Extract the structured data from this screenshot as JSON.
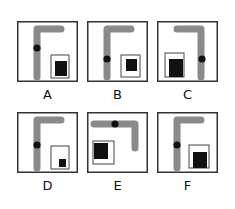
{
  "title": "",
  "colors": {
    "frame": "#333333",
    "bar": "#8a8a8a",
    "dot": "#111111",
    "square": "#111111",
    "inner_box": "#444444"
  },
  "options": [
    {
      "label": "A",
      "x": 17,
      "y": 21,
      "bar": "M20 8 L20 56 M20 8 L44 8",
      "dot": [
        20,
        27
      ],
      "box": [
        34,
        34,
        18,
        23
      ],
      "fill": [
        38,
        40,
        12,
        15
      ]
    },
    {
      "label": "B",
      "x": 87,
      "y": 21,
      "bar": "M20 8 L20 56 M20 8 L44 8",
      "dot": [
        20,
        38
      ],
      "box": [
        34,
        34,
        19,
        22
      ],
      "fill": [
        39,
        38,
        11,
        12
      ]
    },
    {
      "label": "C",
      "x": 157,
      "y": 21,
      "bar": "M44 8 L44 56 M20 8 L44 8",
      "dot": [
        45,
        38
      ],
      "box": [
        8,
        32,
        19,
        24
      ],
      "fill": [
        12,
        38,
        14,
        18
      ]
    },
    {
      "label": "D",
      "x": 17,
      "y": 112,
      "bar": "M20 8 L20 56 M20 8 L44 8",
      "dot": [
        20,
        33
      ],
      "box": [
        34,
        34,
        18,
        23
      ],
      "fill": [
        42,
        47,
        7,
        8
      ]
    },
    {
      "label": "E",
      "x": 87,
      "y": 112,
      "bar": "M7 12 L48 12 M48 12 L48 36",
      "dot": [
        28,
        12
      ],
      "box": [
        6,
        29,
        21,
        23
      ],
      "fill": [
        7,
        31,
        14,
        16
      ]
    },
    {
      "label": "F",
      "x": 157,
      "y": 112,
      "bar": "M20 8 L20 56 M20 8 L44 8",
      "dot": [
        20,
        33
      ],
      "box": [
        32,
        33,
        20,
        23
      ],
      "fill": [
        36,
        40,
        14,
        16
      ]
    }
  ]
}
